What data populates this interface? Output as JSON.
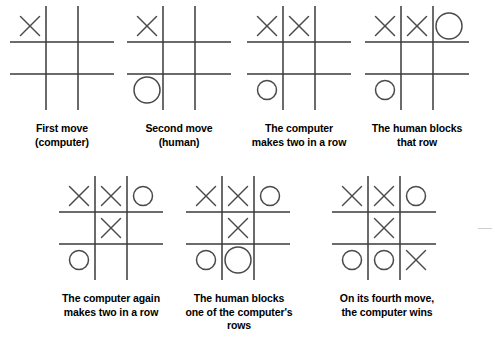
{
  "figure": {
    "background_color": "#ffffff",
    "ink_color": "#3a3a3a",
    "mark_x_label": "X",
    "mark_o_label": "O",
    "empty_label": ""
  },
  "panels": [
    {
      "id": "panel-1",
      "caption": "First move\n(computer)",
      "cells": [
        "X",
        "",
        "",
        "",
        "",
        "",
        "",
        "",
        ""
      ],
      "big_cells": []
    },
    {
      "id": "panel-2",
      "caption": "Second move\n(human)",
      "cells": [
        "X",
        "",
        "",
        "",
        "",
        "",
        "O",
        "",
        ""
      ],
      "big_cells": [
        6
      ]
    },
    {
      "id": "panel-3",
      "caption": "The computer\nmakes two in a row",
      "cells": [
        "X",
        "X",
        "",
        "",
        "",
        "",
        "O",
        "",
        ""
      ],
      "big_cells": []
    },
    {
      "id": "panel-4",
      "caption": "The human blocks\nthat row",
      "cells": [
        "X",
        "X",
        "O",
        "",
        "",
        "",
        "O",
        "",
        ""
      ],
      "big_cells": [
        2
      ]
    },
    {
      "id": "panel-5",
      "caption": "The computer again\nmakes two in a row",
      "cells": [
        "X",
        "X",
        "O",
        "",
        "X",
        "",
        "O",
        "",
        ""
      ],
      "big_cells": []
    },
    {
      "id": "panel-6",
      "caption": "The human blocks\none of the computer's\nrows",
      "cells": [
        "X",
        "X",
        "O",
        "",
        "X",
        "",
        "O",
        "O",
        ""
      ],
      "big_cells": [
        7
      ]
    },
    {
      "id": "panel-7",
      "caption": "On its fourth move,\nthe computer wins",
      "cells": [
        "X",
        "X",
        "O",
        "",
        "X",
        "",
        "O",
        "O",
        "X"
      ],
      "big_cells": []
    }
  ]
}
